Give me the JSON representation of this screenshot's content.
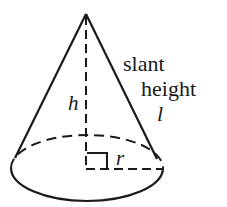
{
  "diagram": {
    "type": "right circular cone",
    "labels": {
      "height": "h",
      "radius": "r",
      "slant_line1": "slant",
      "slant_line2": "height",
      "slant_symbol": "l"
    },
    "colors": {
      "stroke": "#1a1a1a",
      "background": "#ffffff"
    }
  }
}
